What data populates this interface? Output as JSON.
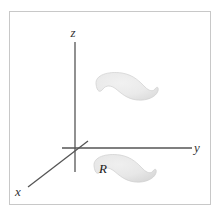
{
  "figure": {
    "kind": "math-diagram",
    "caption_text": "",
    "canvas": {
      "width": 220,
      "height": 215,
      "background": "#ffffff"
    },
    "frame": {
      "name": "figure-border",
      "x": 9.5,
      "y": 11.5,
      "width": 201,
      "height": 193,
      "stroke": "#c8c8c8",
      "stroke_width": 1,
      "fill": "#ffffff"
    },
    "axes": {
      "stroke": "#555555",
      "stroke_width": 1.3,
      "origin": {
        "x": 75,
        "y": 148
      },
      "items": [
        {
          "id": "z",
          "label": "z",
          "orientation": "vertical",
          "x1": 75,
          "y1": 42,
          "x2": 75,
          "y2": 172,
          "label_x": 73,
          "label_y": 37
        },
        {
          "id": "y",
          "label": "y",
          "orientation": "horizontal",
          "x1": 62,
          "y1": 148,
          "x2": 192,
          "y2": 148,
          "label_x": 197,
          "label_y": 152
        },
        {
          "id": "x",
          "label": "x",
          "orientation": "diagonal",
          "x1": 88,
          "y1": 141,
          "x2": 28,
          "y2": 187,
          "label_x": 17,
          "label_y": 196
        }
      ]
    },
    "regions": [
      {
        "id": "upper-surface",
        "label": "",
        "description": "kidney-shaped shaded region floating above the xy-plane",
        "path": "M 96 84 C 95 75 108 71 122 73 C 134 75 140 82 145 87 C 149 91 153 92 155 89 C 157 86 159 87 158 91 C 156 97 147 101 137 100 C 127 99 121 93 116 89 C 111 85 106 85 103 89 C 100 93 97 92 96 84 Z",
        "fill_center": "#ececec",
        "fill_edge": "#dcdcdc",
        "stroke": "#d0d0d0",
        "stroke_width": 0.7,
        "offset_x": 0,
        "offset_y": 0
      },
      {
        "id": "base-region-R",
        "label": "R",
        "description": "kidney-shaped shaded region R lying in the xy-plane",
        "path": "M 96 84 C 95 75 108 71 122 73 C 134 75 140 82 145 87 C 149 91 153 92 155 89 C 157 86 159 87 158 91 C 156 97 147 101 137 100 C 127 99 121 93 116 89 C 111 85 106 85 103 89 C 100 93 97 92 96 84 Z",
        "fill_center": "#eaeaea",
        "fill_edge": "#d8d8d8",
        "stroke": "#cfcfcf",
        "stroke_width": 0.7,
        "offset_x": -2,
        "offset_y": 82,
        "label_x": 103,
        "label_y": 173
      }
    ]
  }
}
